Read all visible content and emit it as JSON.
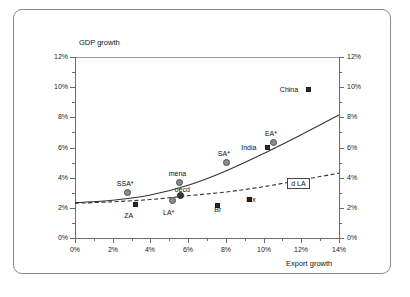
{
  "figure": {
    "border_color": "#8a8a8a",
    "background": "#ffffff"
  },
  "chart_data": {
    "type": "scatter",
    "title": "",
    "xlabel": "Export growth",
    "ylabel": "GDP growth",
    "xlim": [
      0,
      14
    ],
    "ylim": [
      0,
      12
    ],
    "xticks": [
      "0%",
      "2%",
      "4%",
      "6%",
      "8%",
      "10%",
      "12%",
      "14%"
    ],
    "yticks": [
      "0%",
      "2%",
      "4%",
      "6%",
      "8%",
      "10%",
      "12%"
    ],
    "yticks_right": [
      "0%",
      "2%",
      "4%",
      "6%",
      "8%",
      "10%",
      "12%"
    ],
    "grid": false,
    "legend_position": "inline-annotation",
    "x_unit": "%",
    "y_unit": "%",
    "points": [
      {
        "label": "SSA*",
        "x": 2.8,
        "y": 3.0,
        "marker": "circle",
        "label_dx": -2,
        "label_dy": -9
      },
      {
        "label": "ZA",
        "x": 3.25,
        "y": 2.2,
        "marker": "square",
        "label_dx": -3,
        "label_dy": 11
      },
      {
        "label": "LA*",
        "x": 5.2,
        "y": 2.45,
        "marker": "circle",
        "label_dx": -1,
        "label_dy": 12
      },
      {
        "label": "mena",
        "x": 5.55,
        "y": 3.65,
        "marker": "circle",
        "label_dx": -2,
        "label_dy": -9
      },
      {
        "label": "oecd",
        "x": 5.6,
        "y": 2.78,
        "marker": "circle-dark",
        "label_dx": 3,
        "label_dy": -6
      },
      {
        "label": "Br",
        "x": 7.6,
        "y": 2.15,
        "marker": "square",
        "label_dx": 5,
        "label_dy": 4
      },
      {
        "label": "SA*",
        "x": 8.05,
        "y": 5.0,
        "marker": "circle",
        "label_dx": 0,
        "label_dy": -9
      },
      {
        "label": "Mx",
        "x": 9.3,
        "y": 2.55,
        "marker": "square",
        "label_dx": 5,
        "label_dy": 0
      },
      {
        "label": "India",
        "x": 10.25,
        "y": 6.0,
        "marker": "square",
        "label_dx": -18,
        "label_dy": 0
      },
      {
        "label": "EA*",
        "x": 10.55,
        "y": 6.3,
        "marker": "circle",
        "label_dx": 0,
        "label_dy": -9
      },
      {
        "label": "China",
        "x": 12.4,
        "y": 9.8,
        "marker": "square",
        "label_dx": -20,
        "label_dy": 0
      }
    ],
    "curves": [
      {
        "name": "fitted-solid",
        "style": "solid",
        "points": [
          [
            0,
            2.35
          ],
          [
            2,
            2.5
          ],
          [
            4,
            2.85
          ],
          [
            6,
            3.5
          ],
          [
            8,
            4.45
          ],
          [
            10,
            5.6
          ],
          [
            12,
            6.85
          ],
          [
            14,
            8.15
          ]
        ]
      },
      {
        "name": "d-LA",
        "style": "dashed",
        "label": "d LA",
        "label_x": 12.0,
        "label_y": 3.55,
        "points": [
          [
            0,
            2.3
          ],
          [
            2,
            2.4
          ],
          [
            4,
            2.55
          ],
          [
            6,
            2.8
          ],
          [
            8,
            3.05
          ],
          [
            10,
            3.4
          ],
          [
            12,
            3.85
          ],
          [
            14,
            4.3
          ]
        ]
      }
    ]
  }
}
